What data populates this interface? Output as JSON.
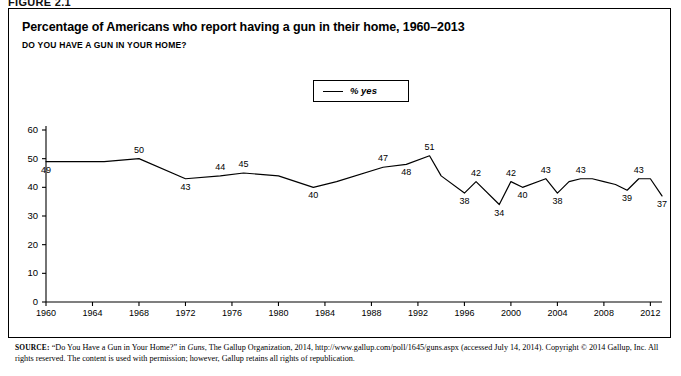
{
  "figure": {
    "label": "FIGURE 2.1"
  },
  "header": {
    "title": "Percentage of Americans who report having a gun in their home, 1960–2013",
    "subtitle": "DO YOU HAVE A GUN IN YOUR HOME?"
  },
  "legend": {
    "series_label": "% yes",
    "position": "top-center",
    "swatch": "line-swatch"
  },
  "source": {
    "prefix": "SOURCE:",
    "text_1": " “Do You Have a Gun in Your Home?” in ",
    "italic_1": "Guns",
    "text_2": ", The Gallup Organization, 2014, http://www.gallup.com/poll/1645/guns.aspx (accessed July 14, 2014). Copyright © 2014 Gallup, Inc. All rights reserved. The content is used with permission; however, Gallup retains all rights of republication."
  },
  "colors": {
    "line": "#000000",
    "axis": "#000000",
    "frame": "#000000",
    "background": "#ffffff"
  },
  "chart_data": {
    "type": "line",
    "title": "Percentage of Americans who report having a gun in their home, 1960–2013",
    "subtitle": "DO YOU HAVE A GUN IN YOUR HOME?",
    "xlabel": "",
    "ylabel": "",
    "xlim": [
      1960,
      2013
    ],
    "ylim": [
      0,
      60
    ],
    "yticks": [
      0,
      10,
      20,
      30,
      40,
      50,
      60
    ],
    "xticks": [
      1960,
      1964,
      1968,
      1972,
      1976,
      1980,
      1984,
      1988,
      1992,
      1996,
      2000,
      2004,
      2008,
      2012
    ],
    "grid": false,
    "legend": [
      "% yes"
    ],
    "series": [
      {
        "name": "% yes",
        "x": [
          1960,
          1965,
          1968,
          1972,
          1975,
          1977,
          1980,
          1983,
          1985,
          1989,
          1991,
          1993,
          1994,
          1996,
          1997,
          1999,
          2000,
          2001,
          2003,
          2004,
          2005,
          2006,
          2007,
          2008,
          2009,
          2010,
          2011,
          2012,
          2013
        ],
        "values": [
          49,
          49,
          50,
          43,
          44,
          45,
          44,
          40,
          42,
          47,
          48,
          51,
          44,
          38,
          42,
          34,
          42,
          40,
          43,
          38,
          42,
          43,
          43,
          42,
          41,
          39,
          43,
          43,
          37
        ]
      }
    ],
    "labeled_points": [
      {
        "x": 1960,
        "y": 49,
        "label": "49",
        "pos": "below"
      },
      {
        "x": 1968,
        "y": 50,
        "label": "50",
        "pos": "above"
      },
      {
        "x": 1972,
        "y": 43,
        "label": "43",
        "pos": "below"
      },
      {
        "x": 1975,
        "y": 44,
        "label": "44",
        "pos": "above"
      },
      {
        "x": 1977,
        "y": 45,
        "label": "45",
        "pos": "above"
      },
      {
        "x": 1983,
        "y": 40,
        "label": "40",
        "pos": "below"
      },
      {
        "x": 1989,
        "y": 47,
        "label": "47",
        "pos": "above"
      },
      {
        "x": 1991,
        "y": 48,
        "label": "48",
        "pos": "below"
      },
      {
        "x": 1993,
        "y": 51,
        "label": "51",
        "pos": "above"
      },
      {
        "x": 1996,
        "y": 38,
        "label": "38",
        "pos": "below"
      },
      {
        "x": 1997,
        "y": 42,
        "label": "42",
        "pos": "above"
      },
      {
        "x": 1999,
        "y": 34,
        "label": "34",
        "pos": "below"
      },
      {
        "x": 2000,
        "y": 42,
        "label": "42",
        "pos": "above"
      },
      {
        "x": 2001,
        "y": 40,
        "label": "40",
        "pos": "below"
      },
      {
        "x": 2003,
        "y": 43,
        "label": "43",
        "pos": "above"
      },
      {
        "x": 2004,
        "y": 38,
        "label": "38",
        "pos": "below"
      },
      {
        "x": 2006,
        "y": 43,
        "label": "43",
        "pos": "above"
      },
      {
        "x": 2010,
        "y": 39,
        "label": "39",
        "pos": "below"
      },
      {
        "x": 2011,
        "y": 43,
        "label": "43",
        "pos": "above"
      },
      {
        "x": 2013,
        "y": 37,
        "label": "37",
        "pos": "below"
      }
    ]
  }
}
